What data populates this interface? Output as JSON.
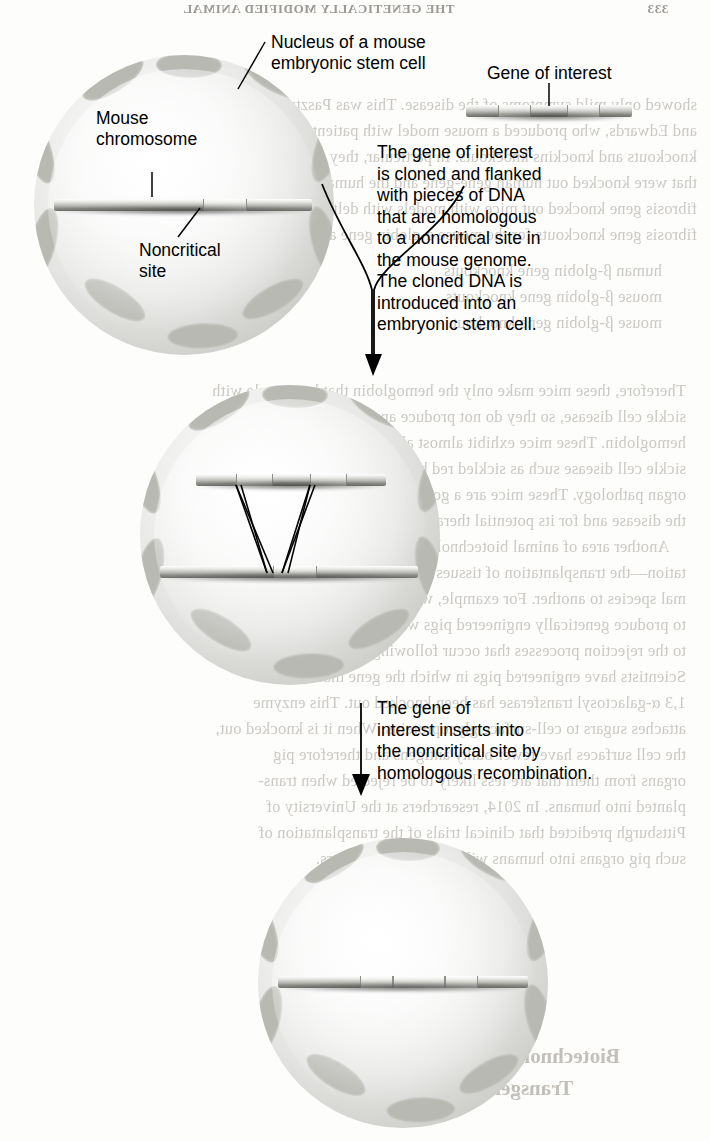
{
  "page": {
    "running_head": "THE GENETICALLY MODIFIED ANIMAL",
    "page_number": "333",
    "width": 710,
    "height": 1141,
    "background": "#fdfdfc",
    "ink": "#000000",
    "ghost_ink": "#c8c5c0"
  },
  "figure": {
    "type": "biology-process-diagram",
    "labels": {
      "nucleus": "Nucleus of a mouse\nembryonic stem cell",
      "mouse_chromosome": "Mouse\nchromosome",
      "noncritical_site": "Noncritical\nsite",
      "gene_of_interest": "Gene of interest"
    },
    "steps": [
      {
        "id": "step-1-clone",
        "text": "The gene of interest\nis cloned and flanked\nwith pieces of DNA\nthat are homologous\nto a noncritical site in\nthe mouse genome.\nThe cloned DNA is\nintroduced into an\nembryonic stem cell."
      },
      {
        "id": "step-2-recombine",
        "text": "The gene of\ninterest inserts into\nthe noncritical site by\nhomologous recombination."
      }
    ],
    "cells": [
      {
        "id": "cell-top",
        "caption": "Embryonic stem cell nucleus with intact mouse chromosome and noncritical site"
      },
      {
        "id": "cell-middle",
        "caption": "Cloned DNA aligned with the chromosome; crossover strands indicate homologous recombination"
      },
      {
        "id": "cell-bottom",
        "caption": "Chromosome with the gene of interest inserted at the noncritical site"
      }
    ]
  },
  "ghost_text": {
    "note": "Faint mirrored show-through from the reverse side of the printed page",
    "lines_right": [
      "showed only mild symptoms of the disease. This was Paszty",
      "and Edwards, who produced a mouse model with patients gene",
      "knockouts and knockins knockouts. In particular, they produced mice",
      "that were knocked out human gene-gene and the human",
      "fibrosis gene knocked out mice with models with delta gene",
      "fibrosis gene knockouts for the mouse a-globin gene and the rabbit are"
    ],
    "lines_block2": [
      "human β-globin gene knockouts",
      "mouse β-globin gene knockouts",
      "mouse β-globin gene knockout."
    ],
    "lines_middle": [
      "Therefore, these mice make only the hemoglobin that has people with",
      "sickle cell disease, so they do not produce any normal mouse",
      "hemoglobin. These mice exhibit almost all the major features of",
      "sickle cell disease such as sickled red blood cells, anemia, and multiple",
      "organ pathology. These mice are a good model for studying",
      "the disease and for its potential therapy.",
      "Another area of animal biotechnology is xenotransplan-",
      "tation—the transplantation of tissues or organs from one ani-",
      "mal species to another. For example, work is currently under way",
      "to produce genetically engineered pigs whose organs are resistant",
      "to the rejection processes that occur following transplantation.",
      "Scientists have engineered pigs in which the gene that encodes",
      "1,3 α-galactosyl transferase has been knocked out. This enzyme",
      "attaches sugars to cell-surface glycoproteins. When it is knocked out,",
      "the cell surfaces have fewer bulky antigens and therefore pig",
      "organs from them that are less likely to be rejected when trans-",
      "planted into humans. In 2014, researchers at the University of",
      "Pittsburgh predicted that clinical trials of the transplantation of",
      "such pig organs into humans will begin in a few years."
    ],
    "heading_bottom": "Biotechnology Is Used in Producing\nTransgenic Livestock"
  }
}
